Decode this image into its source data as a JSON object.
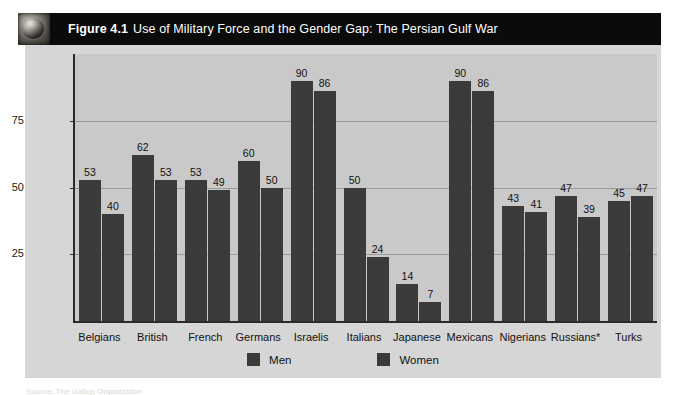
{
  "figure": {
    "icon": "globe-icon",
    "number": "Figure 4.1",
    "title": "Use of Military Force and the Gender Gap: The Persian Gulf War",
    "caption_sliver": "Source: The Gallup Organization"
  },
  "legend": {
    "position": "bottom-center",
    "items": [
      {
        "label": "Men",
        "color": "#3b3b3b"
      },
      {
        "label": "Women",
        "color": "#3a3a3a"
      }
    ]
  },
  "chart_data": {
    "type": "bar",
    "title": "Use of Military Force and the Gender Gap: The Persian Gulf War",
    "xlabel": "",
    "ylabel": "Gender (% willing to use force)",
    "ylim": [
      0,
      100
    ],
    "yticks": [
      25,
      50,
      75
    ],
    "grid": true,
    "categories": [
      "Belgians",
      "British",
      "French",
      "Germans",
      "Israelis",
      "Italians",
      "Japanese",
      "Mexicans",
      "Nigerians",
      "Russians*",
      "Turks"
    ],
    "series": [
      {
        "name": "Men",
        "color": "#3b3b3b",
        "values": [
          53,
          62,
          53,
          60,
          90,
          50,
          14,
          90,
          43,
          47,
          45
        ]
      },
      {
        "name": "Women",
        "color": "#3a3a3a",
        "values": [
          40,
          53,
          49,
          50,
          86,
          24,
          7,
          86,
          41,
          39,
          47
        ]
      }
    ]
  }
}
